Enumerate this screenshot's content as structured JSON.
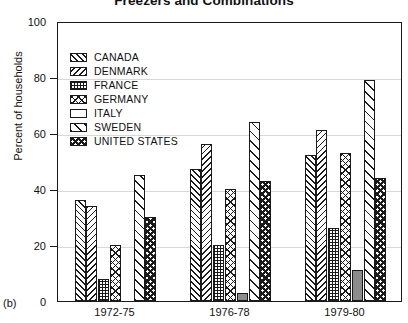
{
  "chart_data": {
    "type": "bar",
    "title": "Freezers and Combinations",
    "xlabel": "",
    "ylabel": "Percent of households",
    "panel_label": "(b)",
    "ylim": [
      0,
      100
    ],
    "yticks": [
      0,
      20,
      40,
      60,
      80,
      100
    ],
    "ytick_labels": [
      "0",
      "20",
      "40",
      "60",
      "80",
      "100"
    ],
    "grid": true,
    "grid_axis": "y",
    "legend_position": "upper-left-inside",
    "categories": [
      "1972-75",
      "1976-78",
      "1979-80"
    ],
    "series": [
      {
        "name": "CANADA",
        "key": "canada",
        "pattern": "diagonal-right-hatch",
        "values": [
          36,
          47,
          52
        ]
      },
      {
        "name": "DENMARK",
        "key": "denmark",
        "pattern": "diagonal-left-hatch",
        "values": [
          34,
          56,
          61
        ]
      },
      {
        "name": "FRANCE",
        "key": "france",
        "pattern": "fine-grid",
        "values": [
          8,
          20,
          26
        ]
      },
      {
        "name": "GERMANY",
        "key": "germany",
        "pattern": "crosshatch",
        "values": [
          20,
          40,
          53
        ]
      },
      {
        "name": "ITALY",
        "key": "italy",
        "pattern": "solid-gray",
        "values": [
          0,
          3,
          11
        ]
      },
      {
        "name": "SWEDEN",
        "key": "sweden",
        "pattern": "wide-diagonal",
        "values": [
          45,
          64,
          79
        ]
      },
      {
        "name": "UNITED STATES",
        "key": "united-states",
        "pattern": "bold-checkerboard",
        "values": [
          30,
          43,
          44
        ]
      }
    ]
  },
  "colors": {
    "ink": "#1a1a1a",
    "grid": "#d8d8d8",
    "italy_fill": "#8c8c8c",
    "background": "#ffffff"
  }
}
